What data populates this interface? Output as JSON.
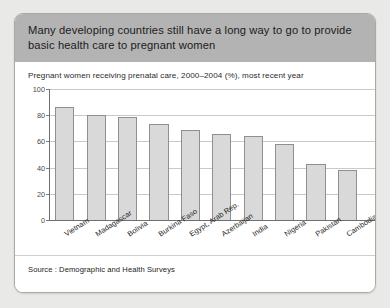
{
  "banner": {
    "title": "Many developing countries still have a long way to go to provide basic health care to pregnant women"
  },
  "source": {
    "text": "Source : Demographic and Health Surveys"
  },
  "colors": {
    "banner_background": "#b3b3b3",
    "card_background": "#ffffff",
    "page_background": "#e9e9e7",
    "bar_fill": "#d9d9d9",
    "bar_border": "#8f8f8f",
    "gridline": "#c9c9c9",
    "axis": "#6f6f6f"
  },
  "chart_data": {
    "type": "bar",
    "title": "Pregnant women receiving prenatal care, 2000–2004 (%), most recent year",
    "xlabel": "",
    "ylabel": "",
    "ylim": [
      0,
      100
    ],
    "yticks": [
      0,
      20,
      40,
      60,
      80,
      100
    ],
    "grid": true,
    "legend": false,
    "categories": [
      "Vietnam",
      "Madagascar",
      "Bolivia",
      "Burkina Faso",
      "Egypt, Arab Rep.",
      "Azerbaijan",
      "India",
      "Nigeria",
      "Pakistan",
      "Cambodia"
    ],
    "values": [
      86,
      80,
      79,
      73,
      69,
      66,
      64,
      58,
      43,
      38
    ]
  }
}
